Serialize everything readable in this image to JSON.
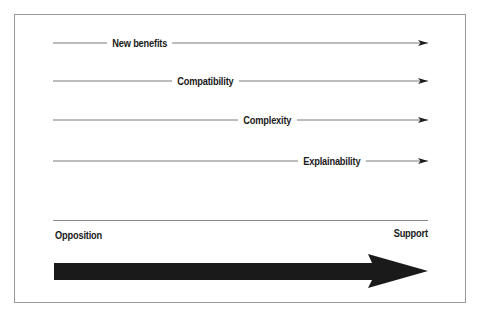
{
  "diagram": {
    "type": "opposition-support continuum",
    "factors": [
      {
        "label": "New benefits",
        "y": 43,
        "label_x": 107
      },
      {
        "label": "Compatibility",
        "y": 81,
        "label_x": 172
      },
      {
        "label": "Complexity",
        "y": 120,
        "label_x": 238
      },
      {
        "label": "Explainability",
        "y": 161,
        "label_x": 298
      }
    ],
    "axis": {
      "left_label": "Opposition",
      "right_label": "Support"
    },
    "colors": {
      "line": "#7a7a7a",
      "arrowhead": "#1c1c1c",
      "big_arrow": "#1a1a1a",
      "border": "#9a9a9a"
    }
  }
}
